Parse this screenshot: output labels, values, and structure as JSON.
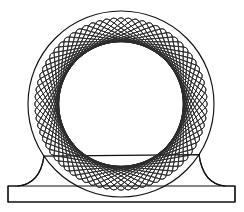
{
  "figure": {
    "background_color": "#ffffff",
    "line_color": "#111111",
    "rosette_line_color": "#2b2b2b"
  },
  "canvas": {
    "width": 244,
    "height": 212
  },
  "outer_circle": {
    "label": "outer circle",
    "cx": 121,
    "cy": 104,
    "r": 93,
    "stroke": "#111111",
    "stroke_width": 1.15
  },
  "rosette": {
    "label": "rotating square rosette",
    "cx": 121,
    "cy": 104,
    "count": 36,
    "angle_step_deg": 5,
    "outer_radius": 88,
    "inner_void_radius": 62,
    "corner_radius": 5,
    "stroke": "#2b2b2b",
    "stroke_width": 0.85
  },
  "pedestal": {
    "label": "pedestal base",
    "rect_x": 8,
    "rect_y": 186,
    "rect_width": 227,
    "rect_height": 16,
    "fillet_left_x": 44,
    "fillet_right_x": 199,
    "fillet_top_y": 161,
    "stroke": "#111111",
    "stroke_width": 1.15
  }
}
